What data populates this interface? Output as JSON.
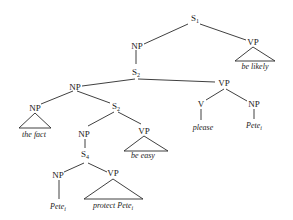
{
  "diagram": {
    "type": "syntax-tree",
    "nodes": {
      "s1": {
        "label": "S",
        "sub": "1"
      },
      "np_top": {
        "label": "NP"
      },
      "vp_top": {
        "label": "VP",
        "leaf": "be likely"
      },
      "s2_top": {
        "label": "S",
        "sub": "2"
      },
      "np_mid": {
        "label": "NP"
      },
      "vp_mid": {
        "label": "VP"
      },
      "v": {
        "label": "V",
        "leaf": "please"
      },
      "np_obj": {
        "label": "NP",
        "leaf": "Pete",
        "leaf_sub": "i"
      },
      "np_fact": {
        "label": "NP",
        "leaf": "the fact"
      },
      "s2_inner": {
        "label": "S",
        "sub": "2"
      },
      "np_inner": {
        "label": "NP"
      },
      "vp_easy": {
        "label": "VP",
        "leaf": "be easy"
      },
      "s4": {
        "label": "S",
        "sub": "4"
      },
      "np_pete": {
        "label": "NP",
        "leaf": "Pete",
        "leaf_sub": "i"
      },
      "vp_protect": {
        "label": "VP",
        "leaf": "protect Pete",
        "leaf_sub": "i"
      }
    }
  }
}
